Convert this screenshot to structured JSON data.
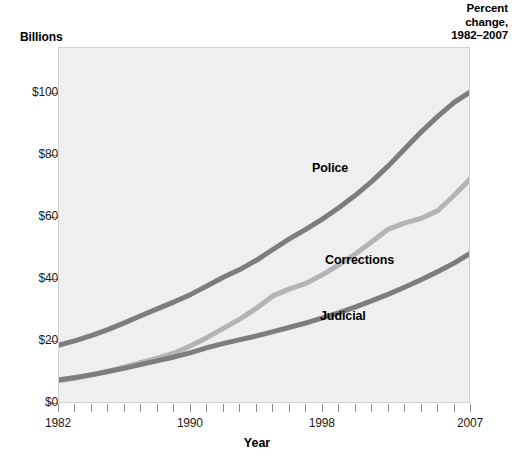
{
  "figure": {
    "units_label": "Billions",
    "x_axis_title": "Year",
    "corner_note_line1": "Percent",
    "corner_note_line2": "change,",
    "corner_note_line3": "1982–2007"
  },
  "chart_data": {
    "type": "line",
    "title": "",
    "xlabel": "Year",
    "ylabel": "Billions",
    "xlim": [
      1982,
      2007
    ],
    "ylim": [
      0,
      115
    ],
    "ytick_values": [
      0,
      20,
      40,
      60,
      80,
      100
    ],
    "ytick_labels": [
      "$0",
      "$20",
      "$40",
      "$60",
      "$80",
      "$100"
    ],
    "xtick_values": [
      1982,
      1983,
      1984,
      1985,
      1986,
      1987,
      1988,
      1989,
      1990,
      1991,
      1992,
      1993,
      1994,
      1995,
      1996,
      1997,
      1998,
      1999,
      2000,
      2001,
      2002,
      2003,
      2004,
      2005,
      2006,
      2007
    ],
    "xtick_labeled": [
      1982,
      1990,
      1998,
      2007
    ],
    "xtick_labels": [
      "1982",
      "1990",
      "1998",
      "2007"
    ],
    "grid": false,
    "legend_position": "inline-annotations",
    "plot_background": "#efefef",
    "x": [
      1982,
      1983,
      1984,
      1985,
      1986,
      1987,
      1988,
      1989,
      1990,
      1991,
      1992,
      1993,
      1994,
      1995,
      1996,
      1997,
      1998,
      1999,
      2000,
      2001,
      2002,
      2003,
      2004,
      2005,
      2006,
      2007
    ],
    "series": [
      {
        "name": "Police",
        "color": "#7d7d7d",
        "label_text": "Police",
        "values": [
          19.0,
          20.5,
          22.2,
          24.1,
          26.3,
          28.6,
          30.8,
          33.0,
          35.4,
          38.2,
          41.0,
          43.5,
          46.5,
          50.0,
          53.4,
          56.5,
          59.8,
          63.5,
          67.5,
          72.0,
          77.0,
          82.5,
          88.0,
          93.0,
          97.5,
          101.0
        ]
      },
      {
        "name": "Corrections",
        "color": "#b4b4b4",
        "label_text": "Corrections",
        "values": [
          7.5,
          8.3,
          9.4,
          10.6,
          12.0,
          13.4,
          14.8,
          16.5,
          18.8,
          21.5,
          24.5,
          27.5,
          31.0,
          35.0,
          37.2,
          39.0,
          41.8,
          45.0,
          48.5,
          52.5,
          56.5,
          58.5,
          60.0,
          62.5,
          67.5,
          73.0
        ]
      },
      {
        "name": "Judicial",
        "color": "#7d7d7d",
        "label_text": "Judicial",
        "values": [
          7.8,
          8.6,
          9.5,
          10.5,
          11.6,
          12.8,
          14.0,
          15.2,
          16.6,
          18.2,
          19.6,
          20.8,
          22.0,
          23.4,
          24.8,
          26.2,
          27.8,
          29.5,
          31.4,
          33.4,
          35.5,
          37.8,
          40.2,
          42.8,
          45.6,
          48.8
        ]
      }
    ]
  }
}
